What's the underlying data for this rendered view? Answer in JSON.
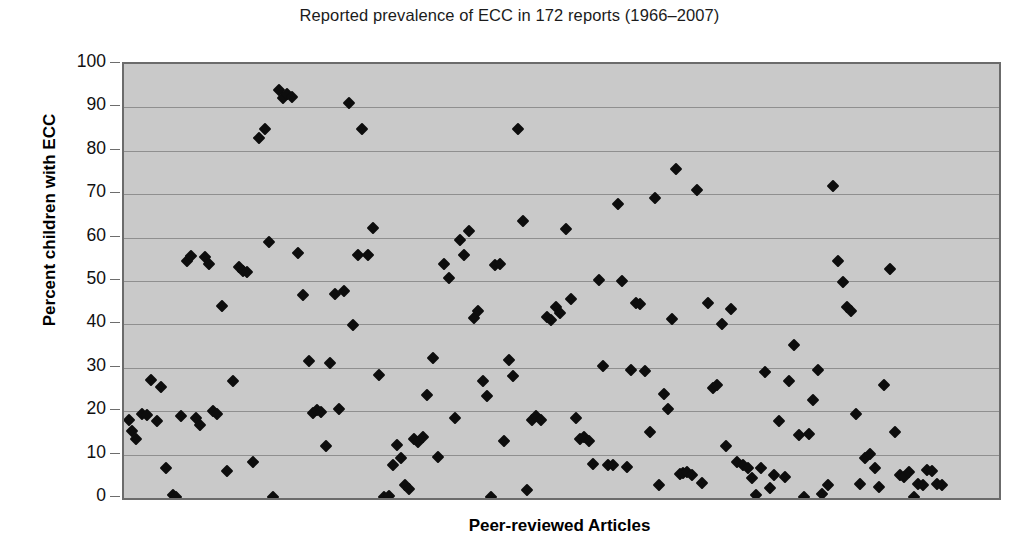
{
  "chart_data": {
    "type": "scatter",
    "title": "Reported prevalence of ECC in 172 reports (1966–2007)",
    "xlabel": "Peer-reviewed Articles",
    "ylabel": "Percent children with ECC",
    "ylim": [
      0,
      100
    ],
    "ytick_labels": [
      "100",
      "90",
      "80",
      "70",
      "60",
      "50",
      "40",
      "30",
      "20",
      "10",
      "0"
    ],
    "ytick_values": [
      100,
      90,
      80,
      70,
      60,
      50,
      40,
      30,
      20,
      10,
      0
    ],
    "xlim": [
      0,
      173
    ],
    "xticks_visible": false,
    "grid": "horizontal",
    "legend": null,
    "marker": "diamond",
    "marker_color": "#0d0d0d",
    "plot_background": "#c9c9c9",
    "gridline_color": "#8f8f8f",
    "n_points": 172,
    "series": [
      {
        "name": "Reported prevalence",
        "points": [
          [
            1,
            18
          ],
          [
            1.6,
            15.5
          ],
          [
            2.4,
            13.7
          ],
          [
            3.5,
            19.3
          ],
          [
            4.6,
            19.2
          ],
          [
            5.4,
            27.2
          ],
          [
            6.6,
            17.8
          ],
          [
            7.4,
            25.6
          ],
          [
            8.3,
            7.0
          ],
          [
            9.6,
            0.6
          ],
          [
            10.2,
            0.2
          ],
          [
            11.3,
            19.0
          ],
          [
            12.4,
            54.5
          ],
          [
            13.2,
            55.8
          ],
          [
            14.3,
            18.4
          ],
          [
            15.1,
            16.8
          ],
          [
            16.0,
            55.6
          ],
          [
            16.8,
            54.0
          ],
          [
            17.6,
            20.0
          ],
          [
            18.4,
            19.4
          ],
          [
            19.4,
            44.3
          ],
          [
            20.3,
            6.3
          ],
          [
            21.6,
            27.0
          ],
          [
            22.8,
            53.3
          ],
          [
            23.5,
            52.4
          ],
          [
            24.4,
            52.0
          ],
          [
            25.6,
            8.2
          ],
          [
            26.6,
            82.9
          ],
          [
            27.8,
            85.0
          ],
          [
            28.6,
            58.9
          ],
          [
            29.5,
            0.2
          ],
          [
            30.6,
            93.9
          ],
          [
            31.4,
            92.2
          ],
          [
            32.3,
            93.2
          ],
          [
            33.2,
            92.3
          ],
          [
            34.4,
            56.4
          ],
          [
            35.3,
            46.8
          ],
          [
            36.5,
            31.6
          ],
          [
            37.3,
            19.5
          ],
          [
            38.2,
            20.3
          ],
          [
            39.0,
            19.8
          ],
          [
            39.9,
            12.0
          ],
          [
            40.8,
            31.2
          ],
          [
            41.7,
            46.9
          ],
          [
            42.6,
            20.5
          ],
          [
            43.5,
            47.7
          ],
          [
            44.4,
            91.0
          ],
          [
            45.3,
            39.9
          ],
          [
            46.2,
            56.0
          ],
          [
            47.1,
            85.0
          ],
          [
            48.2,
            56.1
          ],
          [
            49.3,
            62.2
          ],
          [
            50.4,
            28.4
          ],
          [
            51.5,
            0.2
          ],
          [
            52.3,
            0.4
          ],
          [
            53.1,
            7.6
          ],
          [
            53.9,
            12.2
          ],
          [
            54.7,
            9.3
          ],
          [
            55.6,
            2.9
          ],
          [
            56.4,
            2.0
          ],
          [
            57.3,
            13.6
          ],
          [
            58.2,
            12.8
          ],
          [
            59.1,
            14.0
          ],
          [
            60.0,
            23.8
          ],
          [
            61.0,
            32.2
          ],
          [
            62.0,
            9.5
          ],
          [
            63.2,
            54.0
          ],
          [
            64.3,
            50.6
          ],
          [
            65.4,
            18.5
          ],
          [
            66.4,
            59.4
          ],
          [
            67.3,
            56.0
          ],
          [
            68.3,
            61.6
          ],
          [
            69.2,
            41.5
          ],
          [
            70.0,
            43.0
          ],
          [
            70.9,
            26.9
          ],
          [
            71.7,
            23.6
          ],
          [
            72.5,
            0.3
          ],
          [
            73.4,
            53.7
          ],
          [
            74.3,
            54.0
          ],
          [
            75.2,
            13.1
          ],
          [
            76.1,
            31.8
          ],
          [
            77.0,
            28.0
          ],
          [
            77.9,
            85.0
          ],
          [
            78.8,
            63.9
          ],
          [
            79.7,
            1.8
          ],
          [
            80.6,
            18.0
          ],
          [
            81.5,
            18.8
          ],
          [
            82.5,
            17.9
          ],
          [
            83.7,
            41.6
          ],
          [
            84.5,
            41.0
          ],
          [
            85.4,
            44.0
          ],
          [
            86.3,
            42.6
          ],
          [
            87.4,
            61.9
          ],
          [
            88.3,
            45.8
          ],
          [
            89.3,
            18.5
          ],
          [
            90.2,
            13.7
          ],
          [
            91.0,
            14.0
          ],
          [
            91.9,
            13.2
          ],
          [
            92.8,
            7.8
          ],
          [
            93.9,
            50.2
          ],
          [
            94.7,
            30.4
          ],
          [
            95.7,
            7.5
          ],
          [
            96.6,
            7.6
          ],
          [
            97.6,
            67.8
          ],
          [
            98.5,
            49.9
          ],
          [
            99.4,
            7.2
          ],
          [
            100.3,
            29.6
          ],
          [
            101.2,
            45.0
          ],
          [
            102.1,
            44.6
          ],
          [
            103.0,
            29.2
          ],
          [
            103.9,
            15.3
          ],
          [
            104.9,
            69.1
          ],
          [
            105.8,
            2.9
          ],
          [
            106.7,
            24.0
          ],
          [
            107.6,
            20.5
          ],
          [
            108.3,
            41.3
          ],
          [
            109.1,
            75.9
          ],
          [
            109.9,
            5.5
          ],
          [
            110.6,
            5.7
          ],
          [
            111.4,
            6.1
          ],
          [
            112.3,
            5.4
          ],
          [
            113.3,
            70.9
          ],
          [
            114.3,
            3.5
          ],
          [
            115.4,
            44.9
          ],
          [
            116.4,
            25.3
          ],
          [
            117.3,
            26.0
          ],
          [
            118.2,
            40.0
          ],
          [
            119.1,
            12.0
          ],
          [
            120.1,
            43.6
          ],
          [
            121.2,
            8.2
          ],
          [
            122.3,
            7.5
          ],
          [
            123.3,
            7.0
          ],
          [
            124.1,
            4.5
          ],
          [
            125.0,
            0.6
          ],
          [
            125.9,
            6.9
          ],
          [
            126.8,
            29.1
          ],
          [
            127.7,
            2.3
          ],
          [
            128.6,
            5.2
          ],
          [
            129.6,
            17.8
          ],
          [
            130.6,
            4.8
          ],
          [
            131.5,
            26.9
          ],
          [
            132.4,
            35.3
          ],
          [
            133.4,
            14.6
          ],
          [
            134.4,
            0.3
          ],
          [
            135.4,
            14.8
          ],
          [
            136.3,
            22.5
          ],
          [
            137.2,
            29.5
          ],
          [
            138.1,
            0.9
          ],
          [
            139.2,
            3.0
          ],
          [
            140.2,
            71.9
          ],
          [
            141.2,
            54.5
          ],
          [
            142.1,
            49.8
          ],
          [
            143.0,
            44.0
          ],
          [
            143.8,
            43.0
          ],
          [
            144.7,
            19.3
          ],
          [
            145.6,
            3.3
          ],
          [
            146.6,
            9.2
          ],
          [
            147.5,
            10.1
          ],
          [
            148.4,
            6.8
          ],
          [
            149.3,
            2.6
          ],
          [
            150.3,
            26.0
          ],
          [
            151.4,
            52.7
          ],
          [
            152.4,
            15.2
          ],
          [
            153.4,
            5.4
          ],
          [
            154.3,
            4.8
          ],
          [
            155.2,
            6.0
          ],
          [
            156.1,
            0.2
          ],
          [
            157.0,
            3.2
          ],
          [
            157.9,
            2.9
          ],
          [
            158.8,
            6.5
          ],
          [
            159.8,
            6.3
          ],
          [
            160.8,
            3.2
          ],
          [
            161.8,
            3.0
          ]
        ]
      }
    ]
  }
}
